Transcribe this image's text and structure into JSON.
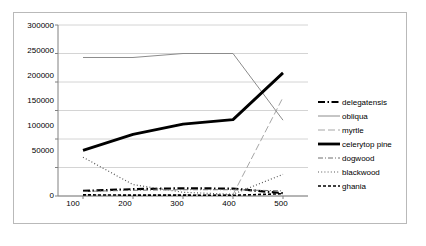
{
  "chart_data": {
    "type": "line",
    "title": "",
    "xlabel": "",
    "ylabel": "",
    "x": [
      100,
      200,
      300,
      400,
      500
    ],
    "xlim": [
      50,
      550
    ],
    "ylim": [
      0,
      300000
    ],
    "xticks": [
      "100",
      "200",
      "300",
      "400",
      "500"
    ],
    "yticks": [
      "0",
      "50000",
      "100000",
      "150000",
      "200000",
      "250000",
      "300000"
    ],
    "grid": "horizontal",
    "legend_position": "right",
    "series": [
      {
        "name": "delegatensis",
        "values": [
          9000,
          12000,
          13500,
          13000,
          5000
        ],
        "style": "dash-dot",
        "color": "#000000",
        "width": 2.2
      },
      {
        "name": "obliqua",
        "values": [
          243000,
          243000,
          250000,
          250000,
          133000
        ],
        "style": "solid",
        "color": "#8c8c8c",
        "width": 1
      },
      {
        "name": "myrtle",
        "values": [
          1500,
          1500,
          2000,
          2500,
          173000
        ],
        "style": "long-dash",
        "color": "#a6a6a6",
        "width": 1
      },
      {
        "name": "celerytop pine",
        "values": [
          80000,
          108000,
          126000,
          134000,
          216000
        ],
        "style": "solid",
        "color": "#000000",
        "width": 2.8
      },
      {
        "name": "dogwood",
        "values": [
          8000,
          10000,
          11000,
          11000,
          9000
        ],
        "style": "dash-dot-thin",
        "color": "#6e6e6e",
        "width": 1
      },
      {
        "name": "blackwood",
        "values": [
          68000,
          20000,
          6500,
          3000,
          38000
        ],
        "style": "dotted",
        "color": "#595959",
        "width": 1.2
      },
      {
        "name": "ghania",
        "values": [
          2000,
          1500,
          1500,
          1200,
          4000
        ],
        "style": "fine-dash",
        "color": "#000000",
        "width": 1.6
      }
    ],
    "legend": [
      "delegatensis",
      "obliqua",
      "myrtle",
      "celerytop pine",
      "dogwood",
      "blackwood",
      "ghania"
    ]
  },
  "colors": {
    "frame_border": "#b9b9b9",
    "axis": "#808080",
    "gridline": "#d4d4d4",
    "background": "#ffffff",
    "text": "#000000"
  }
}
